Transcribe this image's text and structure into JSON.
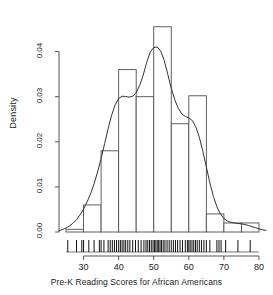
{
  "chart_data": {
    "type": "histogram",
    "title": "",
    "xlabel": "Pre-K Reading Scores for African Americans",
    "ylabel": "Density",
    "xlim": [
      23,
      82
    ],
    "ylim": [
      0,
      0.047
    ],
    "xticks": [
      30,
      40,
      50,
      60,
      70,
      80
    ],
    "xtick_labels": [
      "30",
      "40",
      "50",
      "60",
      "70",
      "80"
    ],
    "yticks": [
      0.0,
      0.01,
      0.02,
      0.03,
      0.04
    ],
    "ytick_labels": [
      "0.00",
      "0.01",
      "0.02",
      "0.03",
      "0.04"
    ],
    "grid": false,
    "legend": false,
    "bin_width": 5,
    "bin_edges": [
      25,
      30,
      35,
      40,
      45,
      50,
      55,
      60,
      65,
      70,
      75,
      80
    ],
    "bin_densities": [
      0.0006,
      0.006,
      0.018,
      0.036,
      0.03,
      0.0455,
      0.024,
      0.0302,
      0.004,
      0.002,
      0.002
    ],
    "bar_color": "#ffffff",
    "bar_edge_color": "#4d4d4d",
    "curve_color": "#333333",
    "axis_color": "#555555",
    "density_curve": [
      [
        23.0,
        0.0003
      ],
      [
        24.0,
        0.00055
      ],
      [
        25.0,
        0.0009
      ],
      [
        26.0,
        0.00135
      ],
      [
        27.0,
        0.00195
      ],
      [
        28.0,
        0.00275
      ],
      [
        29.0,
        0.0038
      ],
      [
        30.0,
        0.0051
      ],
      [
        31.0,
        0.00665
      ],
      [
        32.0,
        0.0085
      ],
      [
        33.0,
        0.0107
      ],
      [
        34.0,
        0.0133
      ],
      [
        35.0,
        0.0163
      ],
      [
        36.0,
        0.0196
      ],
      [
        37.0,
        0.0229
      ],
      [
        38.0,
        0.0259
      ],
      [
        39.0,
        0.0282
      ],
      [
        40.0,
        0.0296
      ],
      [
        41.0,
        0.0301
      ],
      [
        42.0,
        0.03005
      ],
      [
        43.0,
        0.0299
      ],
      [
        44.0,
        0.0301
      ],
      [
        45.0,
        0.0309
      ],
      [
        46.0,
        0.0325
      ],
      [
        47.0,
        0.0348
      ],
      [
        48.0,
        0.0376
      ],
      [
        49.0,
        0.0399
      ],
      [
        50.0,
        0.0409
      ],
      [
        51.0,
        0.041
      ],
      [
        52.0,
        0.0401
      ],
      [
        53.0,
        0.038
      ],
      [
        54.0,
        0.035
      ],
      [
        55.0,
        0.0319
      ],
      [
        56.0,
        0.0293
      ],
      [
        57.0,
        0.0274
      ],
      [
        58.0,
        0.0262
      ],
      [
        59.0,
        0.0256
      ],
      [
        60.0,
        0.0253
      ],
      [
        61.0,
        0.0247
      ],
      [
        62.0,
        0.0233
      ],
      [
        63.0,
        0.021
      ],
      [
        64.0,
        0.0179
      ],
      [
        65.0,
        0.0144
      ],
      [
        66.0,
        0.0109
      ],
      [
        67.0,
        0.0079
      ],
      [
        68.0,
        0.0056
      ],
      [
        69.0,
        0.004
      ],
      [
        70.0,
        0.003
      ],
      [
        71.0,
        0.00245
      ],
      [
        72.0,
        0.00215
      ],
      [
        73.0,
        0.002
      ],
      [
        74.0,
        0.0019
      ],
      [
        75.0,
        0.0018
      ],
      [
        76.0,
        0.00165
      ],
      [
        77.0,
        0.00145
      ],
      [
        78.0,
        0.0012
      ],
      [
        79.0,
        0.00095
      ],
      [
        80.0,
        0.0007
      ],
      [
        81.0,
        0.0005
      ],
      [
        82.0,
        0.00035
      ]
    ],
    "rug_values": [
      25.5,
      28.0,
      29.5,
      30.0,
      31.5,
      33.0,
      34.5,
      35.0,
      35.8,
      37.0,
      37.6,
      38.2,
      38.8,
      39.4,
      40.0,
      40.5,
      41.0,
      41.5,
      42.0,
      42.6,
      43.2,
      44.0,
      44.8,
      45.6,
      46.4,
      47.2,
      47.8,
      48.3,
      48.8,
      49.3,
      49.8,
      50.2,
      50.6,
      51.0,
      51.4,
      51.8,
      52.2,
      52.7,
      53.2,
      53.8,
      54.4,
      55.0,
      55.6,
      56.2,
      56.8,
      57.5,
      58.2,
      59.0,
      59.6,
      60.0,
      60.4,
      60.9,
      61.4,
      61.9,
      62.4,
      63.0,
      63.6,
      64.3,
      65.0,
      66.0,
      68.0,
      68.6,
      69.2,
      70.5,
      74.0,
      77.5
    ]
  }
}
